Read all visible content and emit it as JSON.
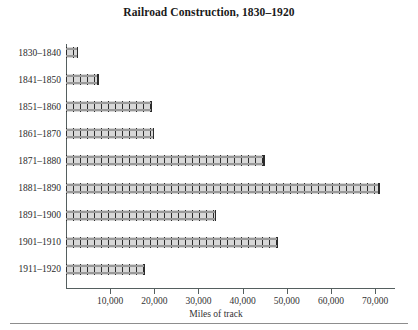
{
  "chart_data": {
    "type": "bar",
    "orientation": "horizontal",
    "title": "Railroad Construction, 1830–1920",
    "xlabel": "Miles of track",
    "ylabel": "",
    "categories": [
      "1830–1840",
      "1841–1850",
      "1851–1860",
      "1861–1870",
      "1871–1880",
      "1881–1890",
      "1891–1900",
      "1901–1910",
      "1911–1920"
    ],
    "values": [
      2800,
      7400,
      19500,
      20000,
      45000,
      71000,
      34000,
      48000,
      18000
    ],
    "xlim": [
      0,
      74500
    ],
    "xticks": [
      10000,
      20000,
      30000,
      40000,
      50000,
      60000,
      70000
    ],
    "xtick_labels": [
      "10,000",
      "20,000",
      "30,000",
      "40,000",
      "50,000",
      "60,000",
      "70,000"
    ],
    "grid": false,
    "legend": null,
    "bar_style": "railroad-track",
    "colors": {
      "rail": "#9a9a9a",
      "tie": "#2b2b2b",
      "bar_fill": "#d8d8d8",
      "axis": "#555f5f",
      "text": "#1a1a1a",
      "footer_rule": "#8d8d8d"
    }
  }
}
